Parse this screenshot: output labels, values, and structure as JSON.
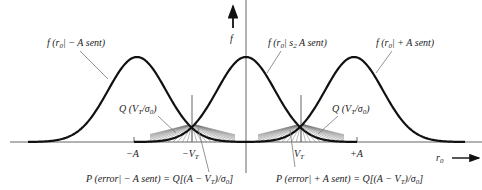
{
  "diagram": {
    "axes": {
      "vertical_label": "f",
      "horizontal_label": "r",
      "horizontal_label_sub": "0"
    },
    "ticks": [
      {
        "id": "neg-A",
        "label": "−A",
        "italic_part": ""
      },
      {
        "id": "neg-VT",
        "label": "−V",
        "sub": "T"
      },
      {
        "id": "pos-VT",
        "label": "V",
        "sub": "T"
      },
      {
        "id": "pos-A",
        "label": "+A"
      }
    ],
    "curves": [
      {
        "id": "neg",
        "label_pre": "f (r",
        "label_sub": "0",
        "label_post": "| − A sent)",
        "mean": "-A"
      },
      {
        "id": "mid",
        "label_pre": "f (r",
        "label_sub": "0",
        "label_mid": "| s",
        "label_sub2": "2",
        "label_post": " A sent)",
        "mean": "0"
      },
      {
        "id": "pos",
        "label_pre": "f (r",
        "label_sub": "0",
        "label_post": "| + A sent)",
        "mean": "+A"
      }
    ],
    "annotations": {
      "q_left": {
        "pre": "Q (V",
        "sub1": "T",
        "mid": "/σ",
        "sub2": "0",
        "post": ")"
      },
      "q_right": {
        "pre": "Q (V",
        "sub1": "T",
        "mid": "/σ",
        "sub2": "0",
        "post": ")"
      },
      "perr_neg": {
        "pre": "P (error| − A sent) = Q[(A − V",
        "sub1": "T",
        "mid": ")/σ",
        "sub2": "0",
        "post": "]"
      },
      "perr_pos": {
        "pre": "P (error| + A sent) = Q[(A − V",
        "sub1": "T",
        "mid": ")/σ",
        "sub2": "0",
        "post": "]"
      }
    }
  }
}
